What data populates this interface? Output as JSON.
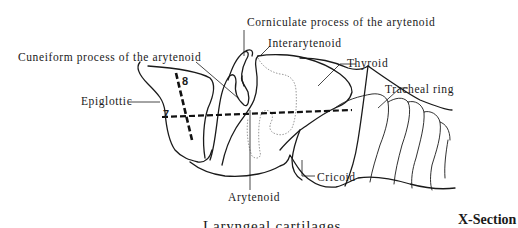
{
  "diagram": {
    "title": "Laryngeal cartilages",
    "section_label": "X-Section",
    "labels": {
      "corniculate": "Corniculate process of the arytenoid",
      "interarytenoid": "Interarytenoid",
      "cuneiform": "Cuneiform process of the arytenoid",
      "thyroid": "Thyroid",
      "tracheal_ring": "Tracheal ring",
      "epiglottic": "Epiglottic",
      "arytenoid": "Arytenoid",
      "cricoid": "Cricoid"
    },
    "section_lines": [
      {
        "number": "7",
        "orientation": "horizontal"
      },
      {
        "number": "8",
        "orientation": "oblique"
      }
    ],
    "colors": {
      "outline": "#1a1a1a",
      "dotted_outline": "#9a9a9a",
      "background": "#ffffff"
    }
  }
}
